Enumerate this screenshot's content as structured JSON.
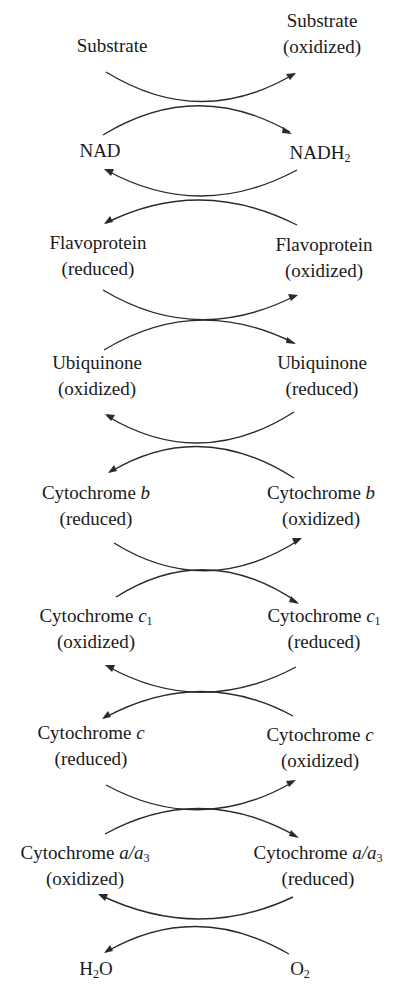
{
  "diagram": {
    "type": "electron-transport-chain-coupled-redox",
    "pairs": [
      {
        "left": {
          "name": "Substrate",
          "state": ""
        },
        "right": {
          "name": "Substrate",
          "state": "(oxidized)"
        }
      },
      {
        "left": {
          "name": "NAD",
          "state": ""
        },
        "right": {
          "name": "NADH",
          "sub": "2",
          "state": ""
        }
      },
      {
        "left": {
          "name": "Flavoprotein",
          "state": "(reduced)"
        },
        "right": {
          "name": "Flavoprotein",
          "state": "(oxidized)"
        }
      },
      {
        "left": {
          "name": "Ubiquinone",
          "state": "(oxidized)"
        },
        "right": {
          "name": "Ubiquinone",
          "state": "(reduced)"
        }
      },
      {
        "left": {
          "name": "Cytochrome ",
          "ital": "b",
          "state": "(reduced)"
        },
        "right": {
          "name": "Cytochrome ",
          "ital": "b",
          "state": "(oxidized)"
        }
      },
      {
        "left": {
          "name": "Cytochrome ",
          "ital": "c",
          "sub": "1",
          "state": "(oxidized)"
        },
        "right": {
          "name": "Cytochrome ",
          "ital": "c",
          "sub": "1",
          "state": "(reduced)"
        }
      },
      {
        "left": {
          "name": "Cytochrome ",
          "ital": "c",
          "state": "(reduced)"
        },
        "right": {
          "name": "Cytochrome ",
          "ital": "c",
          "state": "(oxidized)"
        }
      },
      {
        "left": {
          "name": "Cytochrome ",
          "ital": "a/a",
          "sub": "3",
          "state": "(oxidized)"
        },
        "right": {
          "name": "Cytochrome ",
          "ital": "a/a",
          "sub": "3",
          "state": "(reduced)"
        }
      },
      {
        "left": {
          "name": "H",
          "sub": "2",
          "tail": "O",
          "state": ""
        },
        "right": {
          "name": "O",
          "sub": "2",
          "state": ""
        }
      }
    ],
    "arrow_color": "#2a2a2a"
  }
}
